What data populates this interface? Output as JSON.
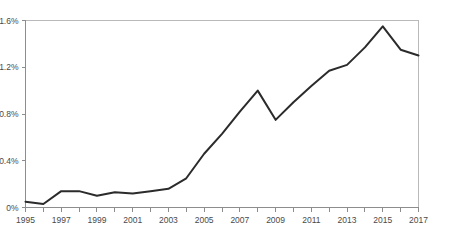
{
  "chart_data": {
    "type": "line",
    "title": "",
    "subtitle": "",
    "xlabel": "",
    "ylabel": "",
    "grid": false,
    "legend": null,
    "legend_position": "none",
    "line_color": "#2b2b2b",
    "axis_color": "#8d8d8d",
    "border_color": "#b9b9b9",
    "label_color": "#4a4a4a",
    "xlim": [
      1995,
      2017
    ],
    "ylim": [
      0,
      1.6
    ],
    "y_ticks": [
      0,
      0.4,
      0.8,
      1.2,
      1.6
    ],
    "y_tick_labels": [
      "0%",
      "0.4%",
      "0.8%",
      "1.2%",
      "1.6%"
    ],
    "x_ticks": [
      1995,
      1996,
      1997,
      1998,
      1999,
      2000,
      2001,
      2002,
      2003,
      2004,
      2005,
      2006,
      2007,
      2008,
      2009,
      2010,
      2011,
      2012,
      2013,
      2014,
      2015,
      2016,
      2017
    ],
    "x_tick_labels": [
      "1995",
      "",
      "1997",
      "",
      "1999",
      "",
      "2001",
      "",
      "2003",
      "",
      "2005",
      "",
      "2007",
      "",
      "2009",
      "",
      "2011",
      "",
      "2013",
      "",
      "2015",
      "",
      "2017"
    ],
    "x": [
      1995,
      1996,
      1997,
      1998,
      1999,
      2000,
      2001,
      2002,
      2003,
      2004,
      2005,
      2006,
      2007,
      2008,
      2009,
      2010,
      2011,
      2012,
      2013,
      2014,
      2015,
      2016,
      2017
    ],
    "values": [
      0.05,
      0.03,
      0.14,
      0.14,
      0.1,
      0.13,
      0.12,
      0.14,
      0.16,
      0.25,
      0.46,
      0.63,
      0.82,
      1.0,
      0.75,
      0.9,
      1.04,
      1.17,
      1.22,
      1.37,
      1.55,
      1.35,
      1.3
    ],
    "units": "%"
  }
}
